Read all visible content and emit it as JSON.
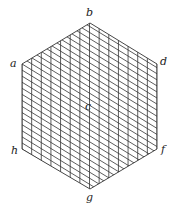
{
  "diagram": {
    "type": "hexagon-grid",
    "line_color": "#333333",
    "background": "#ffffff",
    "divisions": 14,
    "vertices": {
      "a": {
        "label": "a",
        "x": 22,
        "y": 64
      },
      "b": {
        "label": "b",
        "x": 90,
        "y": 23
      },
      "d": {
        "label": "d",
        "x": 157,
        "y": 64
      },
      "f": {
        "label": "f",
        "x": 157,
        "y": 149
      },
      "g": {
        "label": "g",
        "x": 90,
        "y": 189
      },
      "h": {
        "label": "h",
        "x": 22,
        "y": 149
      }
    },
    "center": {
      "label": "c",
      "x": 89,
      "y": 107
    }
  }
}
